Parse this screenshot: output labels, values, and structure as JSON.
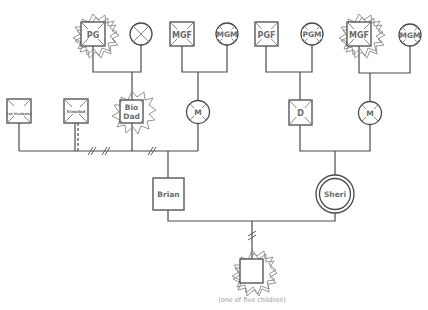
{
  "diagram": {
    "type": "genogram",
    "caption": "(one of five children)",
    "people": [
      {
        "id": "pg",
        "label": "PG",
        "shape": "square",
        "deceased": true,
        "trauma_burst": true
      },
      {
        "id": "pgm_left",
        "label": "",
        "shape": "circle",
        "deceased": true,
        "trauma_burst": false
      },
      {
        "id": "mgf_left",
        "label": "MGF",
        "shape": "square",
        "deceased": true,
        "trauma_burst": false
      },
      {
        "id": "mgm_left",
        "label": "MGM",
        "shape": "circle",
        "deceased": true,
        "trauma_burst": false
      },
      {
        "id": "pgf",
        "label": "PGF",
        "shape": "square",
        "deceased": true,
        "trauma_burst": false
      },
      {
        "id": "pgm",
        "label": "PGM",
        "shape": "circle",
        "deceased": true,
        "trauma_burst": false
      },
      {
        "id": "mgf_right",
        "label": "MGF",
        "shape": "square",
        "deceased": true,
        "trauma_burst": true
      },
      {
        "id": "mgm_right",
        "label": "MGM",
        "shape": "circle",
        "deceased": true,
        "trauma_burst": false
      },
      {
        "id": "first_husband",
        "label": "1st Husband",
        "shape": "square",
        "deceased": true,
        "trauma_burst": false
      },
      {
        "id": "stepdad",
        "label": "Stepdad",
        "shape": "square",
        "deceased": true,
        "trauma_burst": false
      },
      {
        "id": "bio_dad",
        "label_line1": "Bio",
        "label_line2": "Dad",
        "shape": "square",
        "deceased": true,
        "trauma_burst": true
      },
      {
        "id": "m_left",
        "label": "M",
        "shape": "circle",
        "deceased": true,
        "trauma_burst": false
      },
      {
        "id": "d",
        "label": "D",
        "shape": "square",
        "deceased": true,
        "trauma_burst": false
      },
      {
        "id": "m_right",
        "label": "M",
        "shape": "circle",
        "deceased": true,
        "trauma_burst": false
      },
      {
        "id": "brian",
        "label": "Brian",
        "shape": "square",
        "deceased": false,
        "trauma_burst": false
      },
      {
        "id": "sheri",
        "label": "Sheri",
        "shape": "double-circle",
        "deceased": false,
        "trauma_burst": false
      },
      {
        "id": "child",
        "label": "",
        "shape": "square",
        "deceased": false,
        "trauma_burst": true
      }
    ],
    "relationships": [
      {
        "from": "pg",
        "to": "pgm_left",
        "type": "married",
        "child": "bio_dad"
      },
      {
        "from": "mgf_left",
        "to": "mgm_left",
        "type": "married",
        "child": "m_left"
      },
      {
        "from": "pgf",
        "to": "pgm",
        "type": "married",
        "child": "d"
      },
      {
        "from": "mgf_right",
        "to": "mgm_right",
        "type": "married",
        "child": "m_right"
      },
      {
        "from": "m_left",
        "to": "first_husband",
        "type": "divorced"
      },
      {
        "from": "m_left",
        "to": "stepdad",
        "type": "divorced",
        "marker": "double-slash"
      },
      {
        "from": "m_left",
        "to": "bio_dad",
        "type": "divorced",
        "child": "brian"
      },
      {
        "from": "d",
        "to": "m_right",
        "type": "married",
        "child": "sheri"
      },
      {
        "from": "brian",
        "to": "sheri",
        "type": "married",
        "child": "child",
        "child_link": "cutoff"
      }
    ]
  }
}
